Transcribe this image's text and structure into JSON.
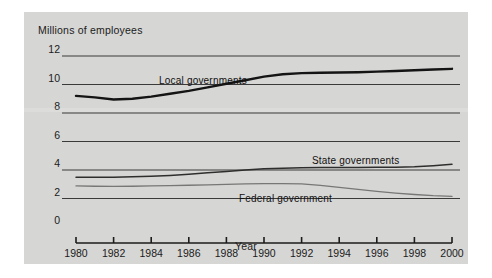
{
  "chart_data": {
    "type": "line",
    "title": "",
    "xlabel": "Year",
    "ylabel": "Millions of employees",
    "xlim": [
      1980,
      2000
    ],
    "ylim": [
      0,
      12
    ],
    "grid": true,
    "legend_position": "inline-labels",
    "xticks": [
      "1980",
      "1982",
      "1984",
      "1986",
      "1988",
      "1990",
      "1992",
      "1994",
      "1996",
      "1998",
      "2000"
    ],
    "yticks": [
      "0",
      "2",
      "4",
      "6",
      "8",
      "10",
      "12"
    ],
    "x": [
      1980,
      1981,
      1982,
      1983,
      1984,
      1985,
      1986,
      1987,
      1988,
      1989,
      1990,
      1991,
      1992,
      1993,
      1994,
      1995,
      1996,
      1997,
      1998,
      1999,
      2000
    ],
    "series": [
      {
        "name": "Local governments",
        "color": "#141414",
        "width": 2.4,
        "values": [
          9.2,
          9.1,
          8.95,
          9.0,
          9.15,
          9.35,
          9.55,
          9.8,
          10.05,
          10.3,
          10.55,
          10.72,
          10.8,
          10.82,
          10.84,
          10.86,
          10.9,
          10.95,
          11.0,
          11.05,
          11.1
        ]
      },
      {
        "name": "State governments",
        "color": "#2e2e2e",
        "width": 1.5,
        "values": [
          3.5,
          3.5,
          3.5,
          3.52,
          3.56,
          3.62,
          3.7,
          3.8,
          3.9,
          4.0,
          4.08,
          4.13,
          4.16,
          4.17,
          4.18,
          4.18,
          4.19,
          4.2,
          4.22,
          4.3,
          4.4
        ]
      },
      {
        "name": "Federal government",
        "color": "#777777",
        "width": 1.3,
        "values": [
          2.88,
          2.86,
          2.85,
          2.86,
          2.88,
          2.9,
          2.93,
          2.96,
          2.99,
          3.02,
          3.05,
          3.05,
          3.02,
          2.92,
          2.78,
          2.64,
          2.5,
          2.38,
          2.28,
          2.2,
          2.15
        ]
      }
    ],
    "series_labels": [
      {
        "text": "Local governments",
        "x_px": 135,
        "y_px": 63
      },
      {
        "text": "State governments",
        "x_px": 288,
        "y_px": 143
      },
      {
        "text": "Federal government",
        "x_px": 215,
        "y_px": 181
      }
    ],
    "axis_color": "#1b1b1b",
    "gridline_color": "#3a3a3a",
    "panel_background": "#d6d6d4",
    "page_background": "#ffffff"
  }
}
